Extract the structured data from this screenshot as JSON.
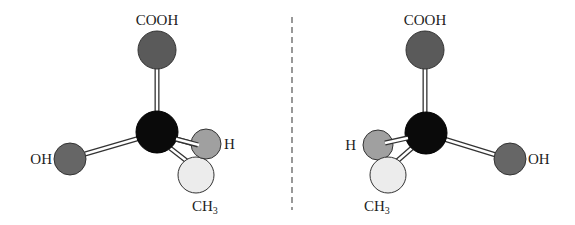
{
  "diagram": {
    "type": "enantiomer-mirror-images",
    "mirror": {
      "style": "dashed",
      "color": "#555555",
      "x": 292,
      "y1": 17,
      "y2": 210
    },
    "colors": {
      "carbon": "#0a0a0a",
      "cooh": "#5a5a5a",
      "oh": "#666666",
      "h": "#a0a0a0",
      "ch3": "#ececec",
      "bond": "#ffffff",
      "outline": "#333333"
    },
    "left": {
      "labels": {
        "cooh": "COOH",
        "oh": "OH",
        "h": "H",
        "ch3_main": "CH",
        "ch3_sub": "3"
      }
    },
    "right": {
      "labels": {
        "cooh": "COOH",
        "oh": "OH",
        "h": "H",
        "ch3_main": "CH",
        "ch3_sub": "3"
      }
    }
  }
}
